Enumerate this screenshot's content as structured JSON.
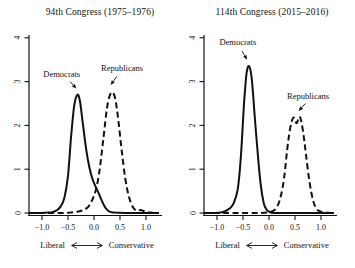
{
  "figure": {
    "background": "#ffffff",
    "ink": "#111111"
  },
  "chart_data": [
    {
      "type": "line",
      "title": "94th Congress (1975–1976)",
      "xlabel_left": "Liberal",
      "xlabel_right": "Conservative",
      "xlim": [
        -1.25,
        1.25
      ],
      "ylim": [
        0,
        4
      ],
      "x_tick_labels": [
        "−1.0",
        "−0.5",
        "0.0",
        "0.5",
        "1.0"
      ],
      "x_tick_values": [
        -1,
        -0.5,
        0,
        0.5,
        1
      ],
      "y_tick_labels": [
        "0",
        "1",
        "2",
        "3",
        "4"
      ],
      "y_tick_values": [
        0,
        1,
        2,
        3,
        4
      ],
      "grid": false,
      "series": [
        {
          "name": "Democrats",
          "line_style": "solid",
          "x": [
            -1.25,
            -1.05,
            -0.9,
            -0.8,
            -0.72,
            -0.64,
            -0.57,
            -0.5,
            -0.44,
            -0.38,
            -0.32,
            -0.27,
            -0.21,
            -0.15,
            -0.09,
            -0.03,
            0.03,
            0.09,
            0.15,
            0.22,
            0.3,
            0.4,
            0.6,
            0.9,
            1.25
          ],
          "y": [
            0,
            0,
            0.01,
            0.02,
            0.06,
            0.15,
            0.35,
            0.85,
            1.75,
            2.45,
            2.7,
            2.55,
            2.0,
            1.45,
            1.05,
            0.78,
            0.6,
            0.45,
            0.28,
            0.12,
            0.03,
            0.01,
            0,
            0,
            0
          ]
        },
        {
          "name": "Republicans",
          "line_style": "dashed",
          "x": [
            -1.25,
            -0.9,
            -0.6,
            -0.45,
            -0.32,
            -0.22,
            -0.12,
            -0.04,
            0.04,
            0.11,
            0.18,
            0.25,
            0.31,
            0.36,
            0.41,
            0.47,
            0.53,
            0.6,
            0.67,
            0.74,
            0.82,
            0.9,
            1.0,
            1.1,
            1.25
          ],
          "y": [
            0,
            0,
            0,
            0.01,
            0.03,
            0.06,
            0.13,
            0.28,
            0.55,
            1.0,
            1.7,
            2.4,
            2.7,
            2.75,
            2.6,
            2.1,
            1.45,
            0.8,
            0.38,
            0.15,
            0.05,
            0.07,
            0.02,
            0.01,
            0
          ]
        }
      ],
      "annotations": [
        {
          "text": "Democrats",
          "text_xy": [
            -0.62,
            3.17
          ],
          "arrow_from": [
            -0.46,
            3.0
          ],
          "arrow_to": [
            -0.34,
            2.84
          ]
        },
        {
          "text": "Republicans",
          "text_xy": [
            0.54,
            3.31
          ],
          "arrow_from": [
            0.44,
            3.12
          ],
          "arrow_to": [
            0.32,
            2.92
          ]
        }
      ]
    },
    {
      "type": "line",
      "title": "114th Congress (2015–2016)",
      "xlabel_left": "Liberal",
      "xlabel_right": "Conservative",
      "xlim": [
        -1.25,
        1.25
      ],
      "ylim": [
        0,
        4
      ],
      "x_tick_labels": [
        "−1.0",
        "−0.5",
        "0.0",
        "0.5",
        "1.0"
      ],
      "x_tick_values": [
        -1,
        -0.5,
        0,
        0.5,
        1
      ],
      "y_tick_labels": [
        "0",
        "1",
        "2",
        "3",
        "4"
      ],
      "y_tick_values": [
        0,
        1,
        2,
        3,
        4
      ],
      "grid": false,
      "series": [
        {
          "name": "Democrats",
          "line_style": "solid",
          "x": [
            -1.25,
            -1.05,
            -0.93,
            -0.84,
            -0.76,
            -0.68,
            -0.6,
            -0.54,
            -0.48,
            -0.43,
            -0.38,
            -0.33,
            -0.28,
            -0.22,
            -0.16,
            -0.1,
            -0.04,
            0.02,
            0.08,
            0.2,
            0.5,
            1.25
          ],
          "y": [
            0,
            0,
            0.01,
            0.04,
            0.1,
            0.22,
            0.55,
            1.3,
            2.5,
            3.2,
            3.35,
            3.05,
            2.3,
            1.4,
            0.65,
            0.22,
            0.07,
            0.02,
            0,
            0,
            0,
            0
          ]
        },
        {
          "name": "Republicans",
          "line_style": "dashed",
          "x": [
            -1.25,
            -0.6,
            -0.2,
            0.0,
            0.08,
            0.15,
            0.22,
            0.29,
            0.35,
            0.41,
            0.47,
            0.53,
            0.59,
            0.65,
            0.71,
            0.78,
            0.85,
            0.92,
            1.0,
            1.1,
            1.25
          ],
          "y": [
            0,
            0,
            0,
            0.02,
            0.05,
            0.13,
            0.35,
            0.8,
            1.45,
            1.95,
            2.18,
            2.05,
            2.2,
            1.9,
            1.35,
            0.7,
            0.28,
            0.09,
            0.03,
            0.01,
            0
          ]
        }
      ],
      "annotations": [
        {
          "text": "Democrats",
          "text_xy": [
            -0.6,
            3.9
          ],
          "arrow_from": [
            -0.52,
            3.7
          ],
          "arrow_to": [
            -0.42,
            3.5
          ]
        },
        {
          "text": "Republicans",
          "text_xy": [
            0.75,
            2.67
          ],
          "arrow_from": [
            0.7,
            2.5
          ],
          "arrow_to": [
            0.57,
            2.33
          ]
        }
      ]
    }
  ]
}
